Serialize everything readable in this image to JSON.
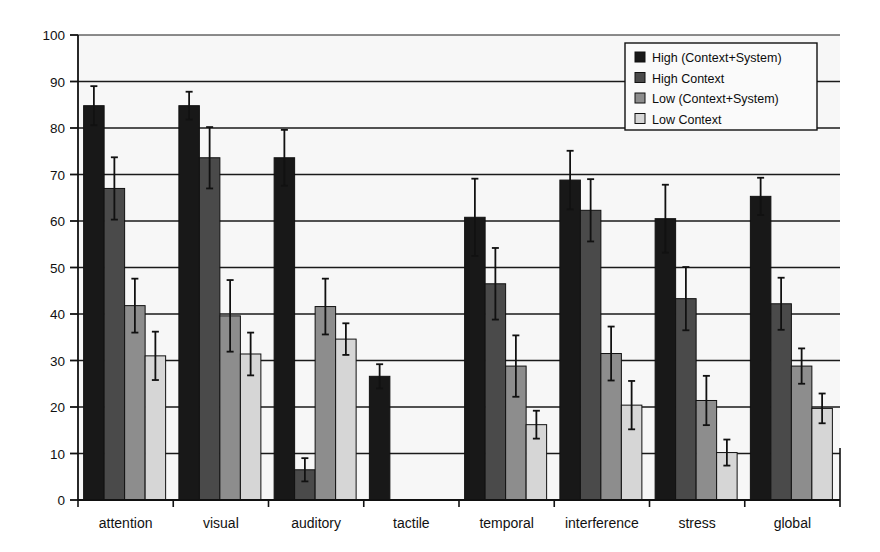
{
  "chart_data": {
    "type": "bar",
    "title": "",
    "subtitle": "",
    "xlabel": "",
    "ylabel": "",
    "ylim": [
      0,
      100
    ],
    "yticks": [
      0,
      10,
      20,
      30,
      40,
      50,
      60,
      70,
      80,
      90,
      100
    ],
    "grid": true,
    "legend_position": "top-right",
    "error_bars": true,
    "categories": [
      "attention",
      "visual",
      "auditory",
      "tactile",
      "temporal",
      "interference",
      "stress",
      "global"
    ],
    "series": [
      {
        "name": "High (Context+System)",
        "color": "#181818",
        "values": [
          84.8,
          84.8,
          73.6,
          26.6,
          60.8,
          68.8,
          60.5,
          65.3
        ],
        "errors": [
          4.2,
          3.0,
          6.0,
          2.6,
          8.3,
          6.3,
          7.3,
          4.0
        ]
      },
      {
        "name": "High Context",
        "color": "#4a4a4a",
        "values": [
          67.0,
          73.6,
          6.5,
          null,
          46.5,
          62.3,
          43.3,
          42.2
        ],
        "errors": [
          6.7,
          6.6,
          2.5,
          null,
          7.7,
          6.7,
          6.8,
          5.6
        ]
      },
      {
        "name": "Low (Context+System)",
        "color": "#8d8d8d",
        "values": [
          41.8,
          39.6,
          41.6,
          null,
          28.8,
          31.5,
          21.4,
          28.8
        ],
        "errors": [
          5.8,
          7.7,
          6.0,
          null,
          6.6,
          5.8,
          5.3,
          3.8
        ]
      },
      {
        "name": "Low Context",
        "color": "#d6d6d6",
        "values": [
          31.0,
          31.4,
          34.6,
          null,
          16.2,
          20.4,
          10.2,
          19.7
        ],
        "errors": [
          5.2,
          4.6,
          3.4,
          null,
          3.0,
          5.2,
          2.8,
          3.2
        ]
      }
    ]
  },
  "axis": {
    "y_tick_labels": [
      "100",
      "90",
      "80",
      "70",
      "60",
      "50",
      "40",
      "30",
      "20",
      "10",
      "0"
    ],
    "x_tick_labels": [
      "attention",
      "visual",
      "auditory",
      "tactile",
      "temporal",
      "interference",
      "stress",
      "global"
    ]
  },
  "legend": {
    "items": [
      {
        "label": "High (Context+System)",
        "swatch": "#181818"
      },
      {
        "label": "High Context",
        "swatch": "#4a4a4a"
      },
      {
        "label": "Low (Context+System)",
        "swatch": "#8d8d8d"
      },
      {
        "label": "Low Context",
        "swatch": "#d6d6d6"
      }
    ]
  },
  "style": {
    "plot_background": "#f7f7f7",
    "gridline_color": "#1a1a1a",
    "axis_color": "#111111",
    "bar_outline": "#111111"
  }
}
